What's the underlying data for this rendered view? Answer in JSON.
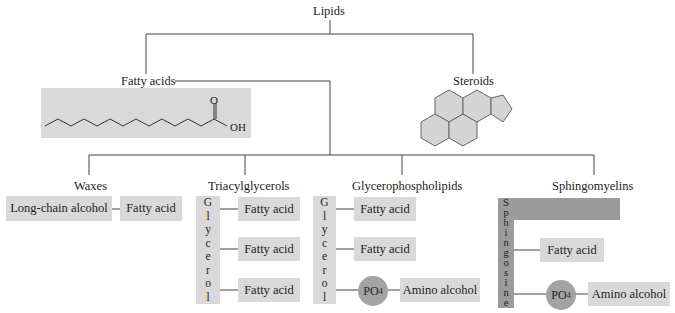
{
  "title": "Lipids",
  "categories": {
    "fatty_acids": {
      "label": "Fatty acids",
      "structure_labels": {
        "carbonyl": "O",
        "hydroxyl": "OH"
      }
    },
    "steroids": {
      "label": "Steroids"
    }
  },
  "subclasses": {
    "waxes": {
      "label": "Waxes",
      "components": [
        "Long-chain alcohol",
        "Fatty acid"
      ]
    },
    "triacylglycerols": {
      "label": "Triacylglycerols",
      "backbone": [
        "G",
        "l",
        "y",
        "c",
        "e",
        "r",
        "o",
        "l"
      ],
      "chains": [
        "Fatty acid",
        "Fatty acid",
        "Fatty acid"
      ]
    },
    "glycerophospholipids": {
      "label": "Glycerophospholipids",
      "backbone": [
        "G",
        "l",
        "y",
        "c",
        "e",
        "r",
        "o",
        "l"
      ],
      "chains": [
        "Fatty acid",
        "Fatty acid"
      ],
      "phosphate": "PO",
      "phosphate_sub": "4",
      "head": "Amino alcohol"
    },
    "sphingomyelins": {
      "label": "Sphingomyelins",
      "backbone": [
        "S",
        "p",
        "h",
        "i",
        "n",
        "g",
        "o",
        "s",
        "i",
        "n",
        "e"
      ],
      "chains": [
        "Fatty acid"
      ],
      "phosphate": "PO",
      "phosphate_sub": "4",
      "head": "Amino alcohol"
    }
  },
  "colors": {
    "box": "#d9d9d9",
    "dark_box": "#9b9b9b",
    "line": "#444444"
  }
}
